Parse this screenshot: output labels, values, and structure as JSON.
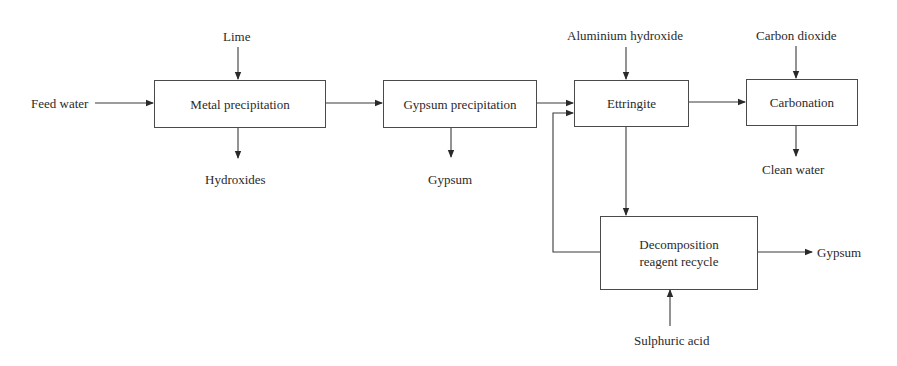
{
  "diagram": {
    "type": "process-flow",
    "nodes": {
      "metal": {
        "label": "Metal precipitation"
      },
      "gypsum_precip": {
        "label": "Gypsum precipitation"
      },
      "ettringite": {
        "label": "Ettringite"
      },
      "carbonation": {
        "label": "Carbonation"
      },
      "decomposition": {
        "line1": "Decomposition",
        "line2": "reagent recycle"
      }
    },
    "inputs": {
      "feed_water": "Feed water",
      "lime": "Lime",
      "aluminium_hydroxide": "Aluminium hydroxide",
      "carbon_dioxide": "Carbon dioxide",
      "sulphuric_acid": "Sulphuric acid"
    },
    "outputs": {
      "hydroxides": "Hydroxides",
      "gypsum_1": "Gypsum",
      "clean_water": "Clean water",
      "gypsum_2": "Gypsum"
    },
    "edges": [
      {
        "from": "Feed water",
        "to": "Metal precipitation"
      },
      {
        "from": "Lime",
        "to": "Metal precipitation"
      },
      {
        "from": "Metal precipitation",
        "to": "Hydroxides"
      },
      {
        "from": "Metal precipitation",
        "to": "Gypsum precipitation"
      },
      {
        "from": "Gypsum precipitation",
        "to": "Gypsum"
      },
      {
        "from": "Gypsum precipitation",
        "to": "Ettringite"
      },
      {
        "from": "Aluminium hydroxide",
        "to": "Ettringite"
      },
      {
        "from": "Ettringite",
        "to": "Carbonation"
      },
      {
        "from": "Carbon dioxide",
        "to": "Carbonation"
      },
      {
        "from": "Carbonation",
        "to": "Clean water"
      },
      {
        "from": "Ettringite",
        "to": "Decomposition reagent recycle"
      },
      {
        "from": "Decomposition reagent recycle",
        "to": "Ettringite"
      },
      {
        "from": "Decomposition reagent recycle",
        "to": "Gypsum"
      },
      {
        "from": "Sulphuric acid",
        "to": "Decomposition reagent recycle"
      }
    ],
    "line_color": "#3a3a3a"
  }
}
